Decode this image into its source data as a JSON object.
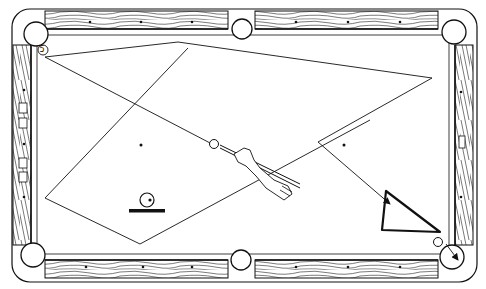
{
  "diagram": {
    "type": "billiards-bank-shot",
    "colors": {
      "ink": "#111111",
      "felt": "#ffffff",
      "wood": "#ffffff"
    },
    "ball_label": "5",
    "legend": {
      "icon": "cue-ball-on-line-icon",
      "meaning": "cue ball"
    },
    "paths": [
      {
        "name": "shot-path-1",
        "points": [
          [
            45,
            57
          ],
          [
            178,
            42
          ],
          [
            432,
            72
          ],
          [
            240,
            150
          ]
        ]
      },
      {
        "name": "shot-path-2",
        "points": [
          [
            45,
            57
          ],
          [
            212,
            144
          ]
        ]
      },
      {
        "name": "shot-path-3",
        "points": [
          [
            188,
            48
          ],
          [
            45,
            198
          ],
          [
            140,
            244
          ],
          [
            370,
            120
          ]
        ]
      },
      {
        "name": "object-ball-path",
        "points": [
          [
            318,
            142
          ],
          [
            392,
            206
          ]
        ]
      }
    ],
    "rack": {
      "shape": "triangle",
      "vertices": [
        [
          386,
          191
        ],
        [
          382,
          230
        ],
        [
          440,
          232
        ]
      ]
    },
    "pockets": [
      "top-left",
      "top-center",
      "top-right",
      "bottom-left",
      "bottom-center",
      "bottom-right"
    ]
  }
}
